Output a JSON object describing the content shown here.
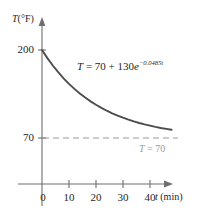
{
  "figure": {
    "background_color": "#ffffff",
    "axis_color": "#6e6e6e",
    "curve_color": "#4d4d4d",
    "asymptote_color": "#9a9a9a",
    "text_color": "#262626"
  },
  "axes": {
    "y_title_var": "T",
    "y_title_unit": "(°F)",
    "x_title_var": "t",
    "x_title_unit": "(min)",
    "y_ticks": [
      "200",
      "70"
    ],
    "x_ticks": [
      "10",
      "20",
      "30",
      "40"
    ],
    "origin_label": "0"
  },
  "annotations": {
    "curve_equation_prefix": "T",
    "curve_equation_body": " = 70 + 130",
    "curve_equation_base": "e",
    "curve_equation_exponent": "−0.0485t",
    "curve_equation_full": "T = 70 + 130e^(−0.0485t)",
    "asymptote_var": "T",
    "asymptote_body": " = 70",
    "asymptote_full": "T = 70"
  },
  "chart_data": {
    "type": "line",
    "title": "",
    "xlabel": "t (min)",
    "ylabel": "T (°F)",
    "xlim": [
      0,
      46
    ],
    "ylim": [
      0,
      230
    ],
    "grid": false,
    "legend": "none",
    "xticks": [
      10,
      20,
      30,
      40
    ],
    "yticks": [
      70,
      200
    ],
    "series": [
      {
        "name": "T = 70 + 130e^(-0.0485t)",
        "equation": "T = 70 + 130*exp(-0.0485*t)",
        "color": "#4d4d4d",
        "style": "solid",
        "x": [
          0,
          2,
          4,
          6,
          8,
          10,
          12,
          14,
          16,
          18,
          20,
          22,
          24,
          26,
          28,
          30,
          32,
          34,
          36,
          38,
          40,
          42,
          44,
          46,
          48
        ],
        "y": [
          200.0,
          188.0,
          177.1,
          167.2,
          158.2,
          150.0,
          142.6,
          135.8,
          129.7,
          124.1,
          119.1,
          114.5,
          110.3,
          106.5,
          103.1,
          100.0,
          97.2,
          94.6,
          92.2,
          90.1,
          88.2,
          86.4,
          84.8,
          83.4,
          82.1
        ]
      },
      {
        "name": "T = 70",
        "equation": "T = 70",
        "color": "#9a9a9a",
        "style": "dashed",
        "x": [
          0,
          46
        ],
        "y": [
          70,
          70
        ]
      }
    ]
  }
}
